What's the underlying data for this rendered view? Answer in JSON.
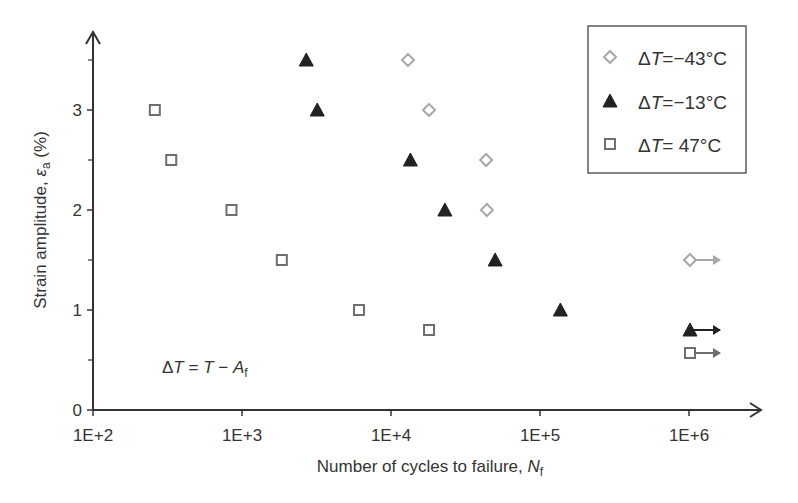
{
  "chart_data": {
    "type": "scatter",
    "title": "",
    "xlabel": "Number of cycles to failure, ",
    "xlabel_italic": "N",
    "xlabel_sub": "f",
    "ylabel": "Strain amplitude, ",
    "ylabel_symbol": "ε",
    "ylabel_sub": "a",
    "ylabel_unit": " (%)",
    "xscale": "log",
    "xlim": [
      100,
      3000000
    ],
    "ylim": [
      0,
      3.8
    ],
    "grid": false,
    "legend_position": "upper right",
    "x_ticks": [
      100,
      1000,
      10000,
      100000,
      1000000
    ],
    "x_tick_labels": [
      "1E+2",
      "1E+3",
      "1E+4",
      "1E+5",
      "1E+6"
    ],
    "y_ticks": [
      0,
      1,
      2,
      3
    ],
    "y_tick_labels": [
      "0",
      "1",
      "2",
      "3"
    ],
    "y_minor_ticks": [
      0.5,
      1.5,
      2.5,
      3.5
    ],
    "annotation": {
      "prefix": "ΔT = T − A",
      "sub": "f"
    },
    "series": [
      {
        "name": "ΔT=−43°C",
        "marker": "diamond-open",
        "color": "#a8a8a8",
        "points": [
          [
            13000,
            3.5
          ],
          [
            18000,
            3.0
          ],
          [
            43500,
            2.5
          ],
          [
            44000,
            2.0
          ]
        ],
        "runouts": [
          [
            1000000,
            1.5
          ]
        ]
      },
      {
        "name": "ΔT=−13°C",
        "marker": "triangle-filled",
        "color": "#222222",
        "points": [
          [
            2700,
            3.5
          ],
          [
            3200,
            3.0
          ],
          [
            13500,
            2.5
          ],
          [
            23000,
            2.0
          ],
          [
            50000,
            1.5
          ],
          [
            137000,
            1.0
          ]
        ],
        "runouts": [
          [
            1000000,
            0.8
          ]
        ]
      },
      {
        "name": "ΔT= 47°C",
        "marker": "square-open",
        "color": "#6e6e6e",
        "points": [
          [
            260,
            3.0
          ],
          [
            335,
            2.5
          ],
          [
            850,
            2.0
          ],
          [
            1850,
            1.5
          ],
          [
            6100,
            1.0
          ],
          [
            18000,
            0.8
          ]
        ],
        "runouts": [
          [
            1000000,
            0.57
          ]
        ]
      }
    ]
  },
  "legend": {
    "items": [
      {
        "prefix": "Δ",
        "var": "T",
        "value": "=−43°C"
      },
      {
        "prefix": "Δ",
        "var": "T",
        "value": "=−13°C"
      },
      {
        "prefix": "Δ",
        "var": "T",
        "value": "= 47°C"
      }
    ]
  }
}
